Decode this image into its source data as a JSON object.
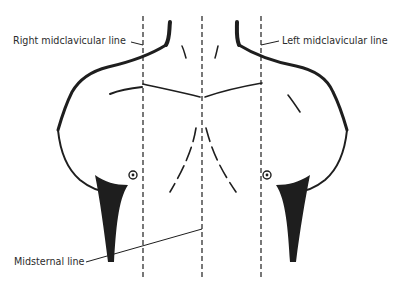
{
  "figure": {
    "labels": {
      "right_midclavicular": "Right midclavicular line",
      "left_midclavicular": "Left midclavicular line",
      "midsternal": "Midsternal line"
    },
    "colors": {
      "ink": "#1e1e1e",
      "text": "#2c2c2c",
      "background": "#ffffff"
    }
  }
}
